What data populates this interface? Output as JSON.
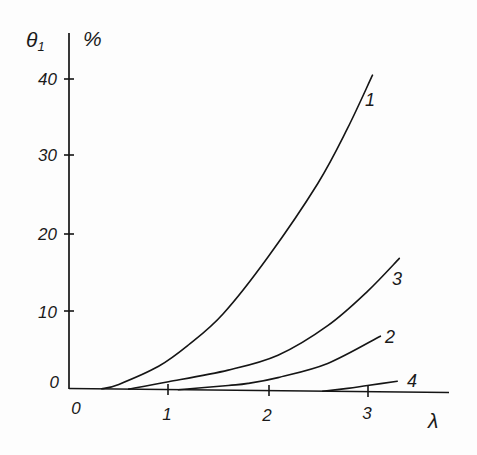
{
  "axes": {
    "y_label": "θ",
    "y_label_subscript": "1",
    "y_unit": "%",
    "x_label": "λ",
    "origin_label": "0",
    "y_tick_labels": [
      "40",
      "30",
      "20",
      "10",
      "0"
    ],
    "x_tick_labels": [
      "1",
      "2",
      "3"
    ]
  },
  "curve_labels": [
    "1",
    "3",
    "2",
    "4"
  ],
  "chart_data": {
    "type": "line",
    "title": "",
    "xlabel": "λ",
    "ylabel": "θ₁, %",
    "xticks": [
      0,
      1,
      2,
      3
    ],
    "yticks": [
      0,
      10,
      20,
      30,
      40
    ],
    "xlim": [
      0,
      3.8
    ],
    "ylim": [
      0,
      45
    ],
    "grid": false,
    "legend": "none (curves labelled inline at their right ends)",
    "series": [
      {
        "name": "1",
        "x": [
          0.33,
          0.5,
          0.9,
          1.2,
          1.55,
          2.0,
          2.5,
          2.8,
          3.05
        ],
        "y": [
          0,
          0.6,
          3.0,
          5.8,
          9.9,
          17.3,
          26.9,
          34.1,
          41.0
        ]
      },
      {
        "name": "3",
        "x": [
          0.6,
          1.0,
          1.6,
          2.1,
          2.6,
          3.0,
          3.32
        ],
        "y": [
          0,
          1.0,
          2.6,
          4.6,
          8.5,
          13.0,
          17.3
        ]
      },
      {
        "name": "2",
        "x": [
          1.1,
          1.6,
          1.8,
          2.1,
          2.6,
          3.13
        ],
        "y": [
          0,
          0.6,
          0.9,
          1.7,
          3.6,
          7.2
        ]
      },
      {
        "name": "4",
        "x": [
          2.55,
          2.8,
          3.0,
          3.3
        ],
        "y": [
          0,
          0.4,
          0.8,
          1.4
        ]
      }
    ]
  }
}
